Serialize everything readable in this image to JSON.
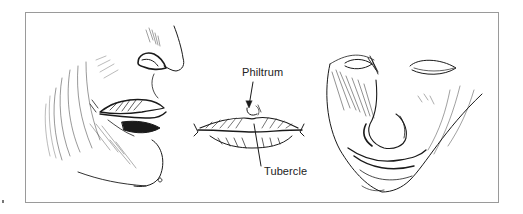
{
  "figure": {
    "panels": [
      {
        "name": "profile-lower-face",
        "description": "Three-quarter profile of lower face showing nose, lips, chin"
      },
      {
        "name": "frontal-lips",
        "description": "Frontal view of lips with labeled anatomy"
      },
      {
        "name": "tilted-face",
        "description": "Face tilted downward with closed eyes, nose and mouth"
      }
    ],
    "labels": {
      "philtrum": "Philtrum",
      "tubercle": "Tubercle"
    },
    "colors": {
      "ink": "#1a1a1a",
      "frame": "#9a9a9a",
      "background": "#ffffff"
    }
  }
}
